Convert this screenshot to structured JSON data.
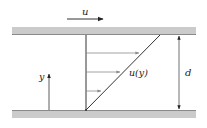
{
  "diagram": {
    "labels": {
      "plate_velocity": "u",
      "profile": "u(y)",
      "y_axis": "y",
      "gap": "d"
    },
    "colors": {
      "plate_fill": "#cbcbcb",
      "plate_edge": "#8a8a8a",
      "line": "#333333",
      "arrow_head": "#888888",
      "profile_arrow": "#7a7a7a"
    },
    "geometry": {
      "plate_left": 12,
      "plate_right": 196,
      "top_plate": {
        "y": 27,
        "height": 8
      },
      "bottom_plate": {
        "y": 110,
        "height": 8
      },
      "profile_origin_x": 86,
      "profile_top_x": 160,
      "profile_arrows_y": [
        53,
        72,
        91
      ],
      "y_axis_x": 49,
      "y_axis_top": 73,
      "gap_dimension_x": 179,
      "top_arrow": {
        "x1": 67,
        "x2": 103,
        "y": 19
      }
    }
  }
}
